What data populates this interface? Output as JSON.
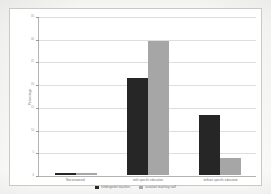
{
  "chart_data": {
    "type": "bar",
    "title": "",
    "xlabel": "",
    "ylabel": "Percentage",
    "ylim": [
      0,
      35
    ],
    "ytick_step": 5,
    "yticks": [
      0,
      5,
      10,
      15,
      20,
      25,
      30,
      35
    ],
    "ytick_labels": [
      "0",
      "5",
      "10",
      "15",
      "20",
      "25",
      "30",
      "35"
    ],
    "grid": true,
    "legend_position": "bottom",
    "categories": [
      "Not answered",
      "with specific education",
      "without specific education"
    ],
    "series": [
      {
        "name": "kindergarten teachers",
        "color": "#262626",
        "values": [
          0.5,
          21.5,
          13.4
        ]
      },
      {
        "name": "assistant teaching staff",
        "color": "#a6a6a6",
        "values": [
          0.5,
          29.7,
          3.7
        ]
      }
    ]
  },
  "colors": {
    "series_dark": "#262626",
    "series_gray": "#a6a6a6",
    "gridline": "#dedede",
    "axis": "#b4b4b4",
    "frame_border": "#c9c9c9",
    "plot_background": "#ffffff",
    "page_background": "#fdfdfc",
    "label_text": "#6f6f6f"
  }
}
